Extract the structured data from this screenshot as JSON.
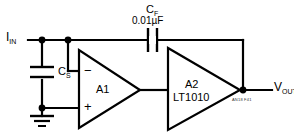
{
  "diagram": {
    "type": "schematic",
    "title_id": "AN18 F41",
    "nodes": {
      "input_label": "I",
      "input_label_sub": "IN",
      "output_label": "V",
      "output_label_sub": "OUT"
    },
    "components": [
      {
        "id": "CS",
        "kind": "capacitor",
        "ref": "C",
        "ref_sub": "S",
        "value": "",
        "orientation": "vertical"
      },
      {
        "id": "CF",
        "kind": "capacitor",
        "ref": "C",
        "ref_sub": "F",
        "value": "0.01µF",
        "orientation": "horizontal"
      },
      {
        "id": "A1",
        "kind": "opamp",
        "label": "A1",
        "part": "",
        "minus": "−",
        "plus": "+"
      },
      {
        "id": "A2",
        "kind": "buffer",
        "label": "A2",
        "part": "LT1010",
        "minus": "",
        "plus": ""
      }
    ],
    "ground": {
      "name": "ground-symbol"
    },
    "colors": {
      "wire": "#000000",
      "background": "#ffffff",
      "text": "#000000"
    }
  }
}
